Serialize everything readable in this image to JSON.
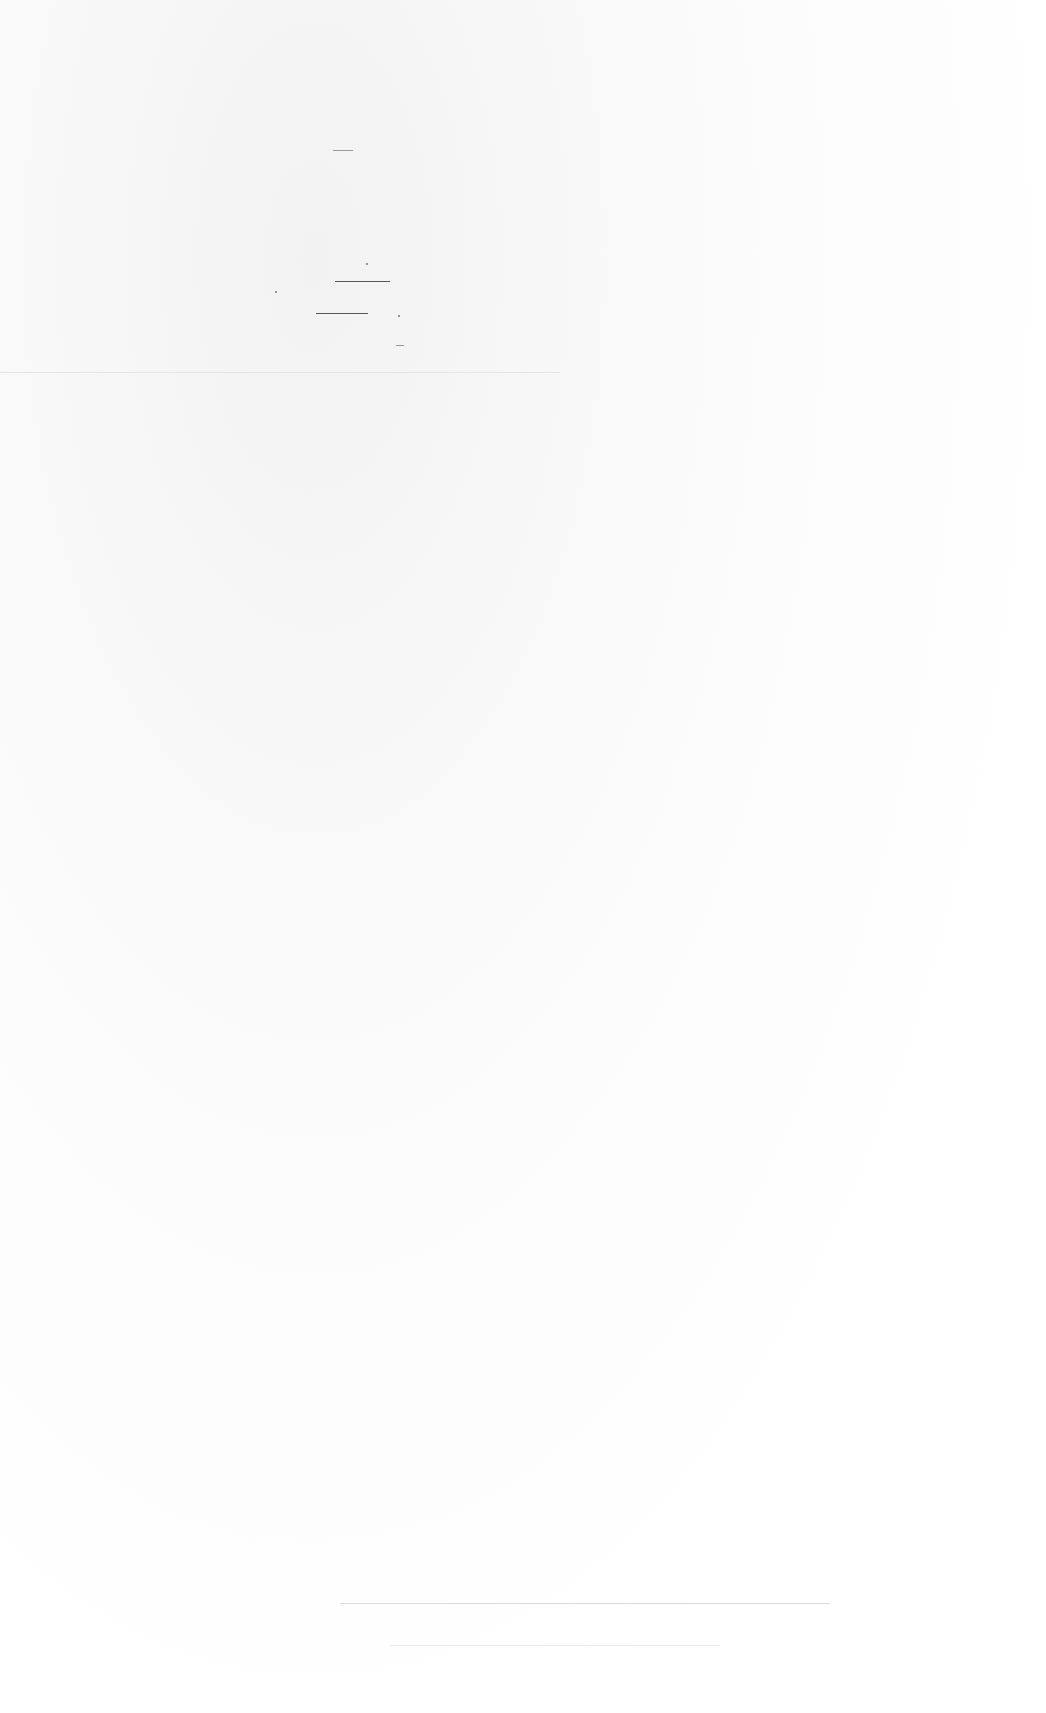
{
  "document": {
    "content": "",
    "colors": {
      "paper": "#fdfdfd",
      "marks": "#555555"
    }
  }
}
